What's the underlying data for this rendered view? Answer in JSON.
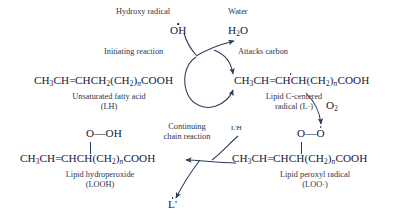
{
  "diagram": {
    "type": "chemical-reaction-scheme",
    "ink_color": "#1d2b45",
    "background": "#ffffff"
  },
  "species": {
    "hydroxy_radical_label": "Hydroxy radical",
    "hydroxy_radical_formula": "OH",
    "water_label": "Water",
    "water_formula_pre": "H",
    "water_formula_sub": "2",
    "water_formula_post": "O",
    "oxygen_label": "O",
    "oxygen_sub": "2",
    "lprime_h": "L'H",
    "lprime_radical": "L'"
  },
  "reactants": {
    "fatty_acid": {
      "formula_parts": [
        "CH",
        "3",
        "CH",
        "=",
        "CHCH",
        "2",
        "(CH",
        "2",
        ")",
        "n",
        "COOH"
      ],
      "name_line1": "Unsaturated fatty acid",
      "name_line2": "(LH)"
    },
    "c_centered_radical": {
      "formula_parts": [
        "CH",
        "3",
        "CH",
        "=",
        "CHCH",
        "(CH",
        "2",
        ")",
        "n",
        "COOH"
      ],
      "name_line1": "Lipid C-centered",
      "name_line2": "radical (L·)"
    },
    "peroxyl_radical": {
      "head_left": "O",
      "head_dash": "—",
      "head_right": "O",
      "formula_parts": [
        "CH",
        "3",
        "CH",
        "=",
        "CHCH",
        "(CH",
        "2",
        ")",
        "n",
        "COOH"
      ],
      "name_line1": "Lipid peroxyl radical",
      "name_line2": "(LOO·)"
    },
    "hydroperoxide": {
      "head_left": "O",
      "head_dash": "—",
      "head_right": "OH",
      "formula_parts": [
        "CH",
        "3",
        "CH",
        "=",
        "CHCH",
        "(CH",
        "2",
        ")",
        "n",
        "COOH"
      ],
      "name_line1": "Lipid hydroperoxide",
      "name_line2": "(LOOH)"
    }
  },
  "process_labels": {
    "initiating": "Initiating reaction",
    "attacks_carbon": "Attacks carbon",
    "continuing_line1": "Continuing",
    "continuing_line2": "chain reaction"
  }
}
